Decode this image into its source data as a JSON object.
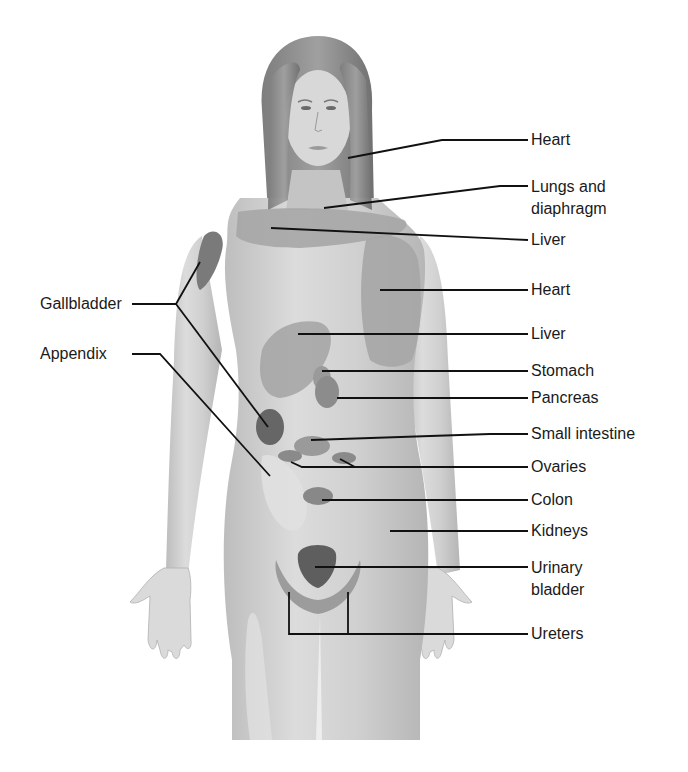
{
  "diagram": {
    "colors": {
      "skin": "#c9c9c9",
      "skin_light": "#e4e4e4",
      "zone": "#a3a3a3",
      "zone_dark": "#7a7a7a",
      "zone_darkest": "#5e5e5e",
      "line": "#111111",
      "hair": "#8d8d8d"
    },
    "right_labels": [
      {
        "id": "heart-upper",
        "text": "Heart"
      },
      {
        "id": "lungs",
        "text": "Lungs and",
        "text2": "diaphragm"
      },
      {
        "id": "liver-upper",
        "text": "Liver"
      },
      {
        "id": "heart-chest",
        "text": "Heart"
      },
      {
        "id": "liver-mid",
        "text": "Liver"
      },
      {
        "id": "stomach",
        "text": "Stomach"
      },
      {
        "id": "pancreas",
        "text": "Pancreas"
      },
      {
        "id": "small-intestine",
        "text": "Small intestine"
      },
      {
        "id": "ovaries",
        "text": "Ovaries"
      },
      {
        "id": "colon",
        "text": "Colon"
      },
      {
        "id": "kidneys",
        "text": "Kidneys"
      },
      {
        "id": "urinary-bladder",
        "text": "Urinary",
        "text2": "bladder"
      },
      {
        "id": "ureters",
        "text": "Ureters"
      }
    ],
    "left_labels": [
      {
        "id": "gallbladder",
        "text": "Gallbladder"
      },
      {
        "id": "appendix",
        "text": "Appendix"
      }
    ]
  }
}
